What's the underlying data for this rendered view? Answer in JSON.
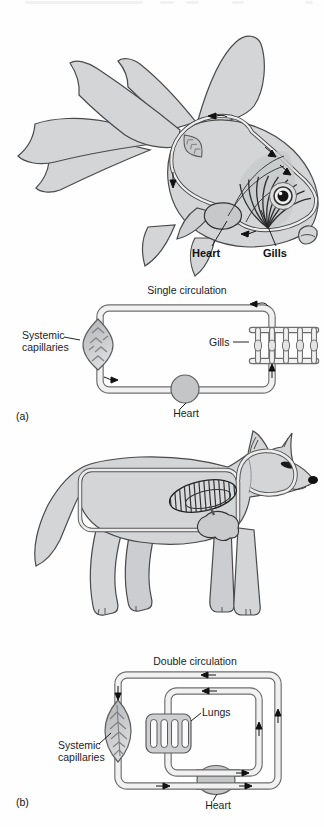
{
  "figure": {
    "colors": {
      "body_fill": "#d4d5d7",
      "outline": "#4a4a4a",
      "pipe_casing": "#6e6e6e",
      "pipe_inner": "#f1f1f2",
      "organ_fill": "#c3c5c7",
      "leaf_dark": "#b5b7b9",
      "leaf_light": "#dcdddf",
      "text": "#1c1c1c"
    }
  },
  "panel_a": {
    "tag": "(a)",
    "animal": "goldfish",
    "animal_labels": {
      "heart": "Heart",
      "gills": "Gills"
    },
    "schematic": {
      "title": "Single circulation",
      "systemic_capillaries_line1": "Systemic",
      "systemic_capillaries_line2": "capillaries",
      "gills": "Gills",
      "heart": "Heart"
    }
  },
  "panel_b": {
    "tag": "(b)",
    "animal": "fox",
    "schematic": {
      "title": "Double circulation",
      "lungs": "Lungs",
      "systemic_capillaries_line1": "Systemic",
      "systemic_capillaries_line2": "capillaries",
      "heart": "Heart"
    }
  }
}
